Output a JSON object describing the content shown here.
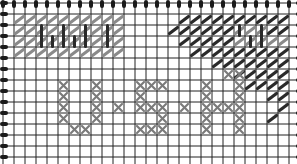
{
  "diagram": {
    "type": "stitch-pattern-chart",
    "grid": {
      "cols": 27,
      "rows": 15,
      "cell": 11,
      "origin_x": 3,
      "origin_y": 3,
      "line_color": "#222222"
    },
    "colors": {
      "background": "#ffffff",
      "grid": "#222222",
      "edge_tick": "#1a1a1a",
      "light_stitch": "#8a8a8a",
      "dark_stitch": "#2a2a2a",
      "cross_stitch": "#7a7a7a"
    },
    "light_diagonals": [
      [
        1,
        1
      ],
      [
        2,
        1
      ],
      [
        3,
        1
      ],
      [
        4,
        1
      ],
      [
        5,
        1
      ],
      [
        6,
        1
      ],
      [
        7,
        1
      ],
      [
        8,
        1
      ],
      [
        9,
        1
      ],
      [
        10,
        1
      ],
      [
        1,
        2
      ],
      [
        2,
        2
      ],
      [
        3,
        2
      ],
      [
        4,
        2
      ],
      [
        5,
        2
      ],
      [
        6,
        2
      ],
      [
        7,
        2
      ],
      [
        8,
        2
      ],
      [
        9,
        2
      ],
      [
        10,
        2
      ],
      [
        1,
        3
      ],
      [
        2,
        3
      ],
      [
        3,
        3
      ],
      [
        4,
        3
      ],
      [
        5,
        3
      ],
      [
        6,
        3
      ],
      [
        7,
        3
      ],
      [
        8,
        3
      ],
      [
        9,
        3
      ],
      [
        10,
        3
      ],
      [
        1,
        4
      ],
      [
        2,
        4
      ],
      [
        3,
        4
      ],
      [
        4,
        4
      ],
      [
        5,
        4
      ],
      [
        6,
        4
      ],
      [
        7,
        4
      ],
      [
        8,
        4
      ],
      [
        9,
        4
      ],
      [
        10,
        4
      ],
      [
        21,
        2
      ],
      [
        22,
        2
      ],
      [
        23,
        2
      ],
      [
        24,
        2
      ],
      [
        21,
        3
      ],
      [
        22,
        3
      ],
      [
        23,
        3
      ],
      [
        24,
        3
      ],
      [
        25,
        3
      ]
    ],
    "dark_verticals": [
      [
        3,
        2
      ],
      [
        3,
        3
      ],
      [
        4,
        3
      ],
      [
        5,
        2
      ],
      [
        5,
        3
      ],
      [
        6,
        3
      ],
      [
        7,
        2
      ],
      [
        7,
        3
      ],
      [
        9,
        2
      ],
      [
        9,
        3
      ],
      [
        21,
        2
      ],
      [
        22,
        3
      ],
      [
        23,
        2
      ],
      [
        23,
        3
      ]
    ],
    "dark_diagonals": [
      [
        16,
        1
      ],
      [
        17,
        1
      ],
      [
        18,
        1
      ],
      [
        19,
        1
      ],
      [
        20,
        1
      ],
      [
        21,
        1
      ],
      [
        22,
        1
      ],
      [
        23,
        1
      ],
      [
        24,
        1
      ],
      [
        25,
        1
      ],
      [
        15,
        2
      ],
      [
        16,
        2
      ],
      [
        17,
        2
      ],
      [
        18,
        2
      ],
      [
        19,
        2
      ],
      [
        20,
        2
      ],
      [
        24,
        2
      ],
      [
        25,
        2
      ],
      [
        16,
        3
      ],
      [
        17,
        3
      ],
      [
        18,
        3
      ],
      [
        19,
        3
      ],
      [
        20,
        3
      ],
      [
        17,
        4
      ],
      [
        18,
        4
      ],
      [
        19,
        4
      ],
      [
        20,
        4
      ],
      [
        21,
        4
      ],
      [
        22,
        4
      ],
      [
        23,
        4
      ],
      [
        24,
        4
      ],
      [
        25,
        4
      ],
      [
        19,
        5
      ],
      [
        20,
        5
      ],
      [
        21,
        5
      ],
      [
        22,
        5
      ],
      [
        23,
        5
      ],
      [
        24,
        5
      ],
      [
        25,
        5
      ],
      [
        21,
        6
      ],
      [
        22,
        6
      ],
      [
        23,
        6
      ],
      [
        24,
        6
      ],
      [
        25,
        6
      ],
      [
        22,
        7
      ],
      [
        23,
        7
      ],
      [
        24,
        7
      ],
      [
        25,
        7
      ],
      [
        24,
        8
      ],
      [
        25,
        8
      ],
      [
        25,
        9
      ],
      [
        24,
        10
      ]
    ],
    "cross_stitches": [
      [
        5,
        7
      ],
      [
        5,
        8
      ],
      [
        5,
        9
      ],
      [
        5,
        10
      ],
      [
        6,
        11
      ],
      [
        7,
        11
      ],
      [
        8,
        7
      ],
      [
        8,
        8
      ],
      [
        8,
        9
      ],
      [
        8,
        10
      ],
      [
        10,
        9
      ],
      [
        12,
        7
      ],
      [
        13,
        7
      ],
      [
        14,
        7
      ],
      [
        12,
        8
      ],
      [
        12,
        9
      ],
      [
        13,
        9
      ],
      [
        14,
        9
      ],
      [
        14,
        10
      ],
      [
        12,
        11
      ],
      [
        13,
        11
      ],
      [
        14,
        11
      ],
      [
        16,
        9
      ],
      [
        18,
        7
      ],
      [
        18,
        8
      ],
      [
        18,
        9
      ],
      [
        18,
        10
      ],
      [
        18,
        11
      ],
      [
        19,
        9
      ],
      [
        20,
        9
      ],
      [
        20,
        6
      ],
      [
        21,
        6
      ],
      [
        21,
        7
      ],
      [
        21,
        8
      ],
      [
        21,
        9
      ],
      [
        21,
        10
      ],
      [
        21,
        11
      ]
    ],
    "letters_hint": [
      "U",
      "S",
      "H"
    ]
  }
}
